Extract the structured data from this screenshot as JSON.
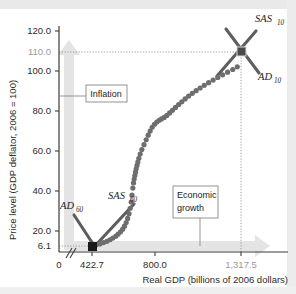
{
  "chart_data": {
    "type": "scatter",
    "title": "",
    "xlabel": "Real GDP (billions of 2006 dollars)",
    "ylabel": "Price level (GDP deflator, 2006 = 100)",
    "xticks": [
      "0",
      "422.7",
      "800.0",
      "1,317.5"
    ],
    "yticks": [
      "120.0",
      "110.0",
      "100.0",
      "80.0",
      "60.0",
      "40.0",
      "20.0",
      "6.1"
    ],
    "xlim": [
      0,
      1500
    ],
    "ylim": [
      0,
      128
    ],
    "grid": false,
    "axis_break": true,
    "legend_position": "none",
    "x": [
      422.7,
      447,
      470,
      492,
      512,
      530,
      548,
      566,
      580,
      594,
      607,
      618,
      628,
      637,
      645,
      652,
      658,
      663,
      668,
      672,
      676,
      680,
      684,
      688,
      693,
      698,
      704,
      712,
      722,
      735,
      748,
      760,
      772,
      784,
      798,
      812,
      826,
      840,
      856,
      872,
      889,
      906,
      924,
      943,
      962,
      982,
      1003,
      1025,
      1048,
      1072,
      1097,
      1123,
      1150,
      1178,
      1207,
      1237,
      1268,
      1295,
      1317.5
    ],
    "y": [
      6.1,
      6.6,
      7.2,
      7.9,
      8.6,
      9.4,
      10.3,
      11.3,
      12.4,
      13.6,
      15.0,
      16.6,
      18.5,
      20.7,
      23.2,
      26.1,
      29.4,
      33.0,
      36.8,
      39.5,
      41.6,
      43.4,
      45.2,
      47.0,
      48.8,
      50.6,
      52.6,
      54.8,
      57.2,
      59.8,
      62.4,
      64.8,
      67.0,
      69.0,
      70.6,
      71.8,
      72.7,
      73.4,
      74.2,
      75.3,
      76.6,
      78.0,
      79.5,
      81.0,
      82.5,
      84.0,
      85.5,
      87.0,
      88.4,
      89.8,
      91.2,
      92.6,
      94.0,
      95.4,
      96.8,
      98.2,
      99.6,
      101.0,
      110.0
    ],
    "series_name": "Aggregate demand / supply equilibrium path",
    "equilibrium_points": [
      {
        "name": "equilibrium-1960",
        "x": 422.7,
        "y": 6.1,
        "marker": "filled-square"
      },
      {
        "name": "equilibrium-2010",
        "x": 1317.5,
        "y": 110.0,
        "marker": "filled-square"
      }
    ],
    "curves": [
      {
        "label": "AD",
        "subscript": "60",
        "year": 1960,
        "type": "aggregate-demand"
      },
      {
        "label": "SAS",
        "subscript": "60",
        "year": 1960,
        "type": "short-run-aggregate-supply"
      },
      {
        "label": "SAS",
        "subscript": "10",
        "year": 2010,
        "type": "short-run-aggregate-supply"
      },
      {
        "label": "AD",
        "subscript": "10",
        "year": 2010,
        "type": "aggregate-demand"
      }
    ],
    "annotations": [
      {
        "name": "inflation",
        "text": "Inflation",
        "direction": "vertical-up"
      },
      {
        "name": "economic-growth",
        "text_line1": "Economic",
        "text_line2": "growth",
        "direction": "horizontal-right"
      }
    ],
    "colors": {
      "data_points": "#6e6e6e",
      "curve_lines": "#5e5e5e",
      "equilibrium_marker": "#191919",
      "axis": "#3b3b3b",
      "guide_line": "#9a9a9a",
      "arrow_fill": "#e4e4e4",
      "highlight_tick": "#9a9a9a"
    }
  },
  "labels": {
    "ad60": "AD",
    "ad60_sub": "60",
    "sas60": "SAS",
    "sas60_sub": "60",
    "sas10": "SAS",
    "sas10_sub": "10",
    "ad10": "AD",
    "ad10_sub": "10"
  },
  "ticks": {
    "y": {
      "t120": "120.0",
      "t110": "110.0",
      "t100": "100.0",
      "t80": "80.0",
      "t60": "60.0",
      "t40": "40.0",
      "t20": "20.0",
      "t61": "6.1"
    },
    "x": {
      "t0": "0",
      "t4227": "422.7",
      "t800": "800.0",
      "t13175": "1,317.5"
    }
  },
  "axes": {
    "x_title": "Real GDP (billions of 2006 dollars)",
    "y_title": "Price level (GDP deflator, 2006 = 100)"
  },
  "callouts": {
    "inflation": "Inflation",
    "growth_line1": "Economic",
    "growth_line2": "growth"
  }
}
